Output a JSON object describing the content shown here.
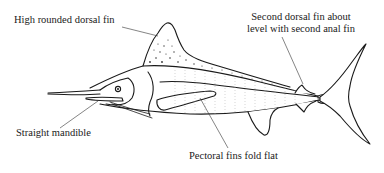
{
  "diagram": {
    "labels": [
      {
        "id": "dorsal",
        "text": "High rounded dorsal fin"
      },
      {
        "id": "second-dorsal",
        "lines": [
          "Second dorsal fin about",
          "level with second anal fin"
        ]
      },
      {
        "id": "mandible",
        "text": "Straight mandible"
      },
      {
        "id": "pectoral",
        "text": "Pectoral fins fold flat"
      }
    ],
    "colors": {
      "line": "#1a1a1a",
      "background": "#ffffff"
    }
  }
}
